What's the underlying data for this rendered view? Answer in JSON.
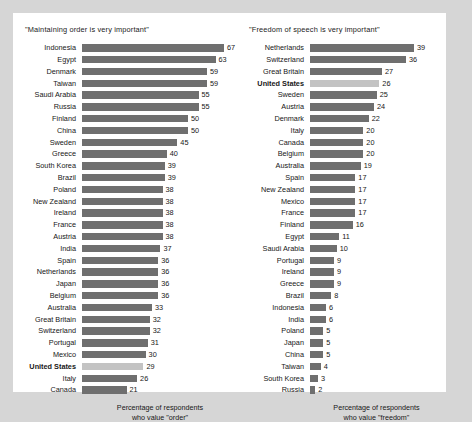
{
  "chart_data": [
    {
      "type": "bar",
      "orientation": "horizontal",
      "title": "\"Maintaining order is very important\"",
      "xlabel": "Percentage of respondents who value \"order\"",
      "ylabel": "",
      "xlim": [
        0,
        67
      ],
      "grid": false,
      "legend": "none",
      "highlight_category": "United States",
      "categories": [
        "Indonesia",
        "Egypt",
        "Denmark",
        "Taiwan",
        "Saudi Arabia",
        "Russia",
        "Finland",
        "China",
        "Sweden",
        "Greece",
        "South Korea",
        "Brazil",
        "Poland",
        "New Zealand",
        "Ireland",
        "France",
        "Austria",
        "India",
        "Spain",
        "Netherlands",
        "Japan",
        "Belgium",
        "Australia",
        "Great Britain",
        "Switzerland",
        "Portugal",
        "Mexico",
        "United States",
        "Italy",
        "Canada"
      ],
      "values": [
        67,
        63,
        59,
        59,
        55,
        55,
        50,
        50,
        45,
        40,
        39,
        39,
        38,
        38,
        38,
        38,
        38,
        37,
        36,
        36,
        36,
        36,
        33,
        32,
        32,
        31,
        30,
        29,
        26,
        21
      ]
    },
    {
      "type": "bar",
      "orientation": "horizontal",
      "title": "\"Freedom of speech is very important\"",
      "xlabel": "Percentage of respondents who value \"freedom\"",
      "ylabel": "",
      "xlim": [
        0,
        39
      ],
      "grid": false,
      "legend": "none",
      "highlight_category": "United States",
      "categories": [
        "Netherlands",
        "Switzerland",
        "Great Britain",
        "United States",
        "Sweden",
        "Austria",
        "Denmark",
        "Italy",
        "Canada",
        "Belgium",
        "Australia",
        "Spain",
        "New Zealand",
        "Mexico",
        "France",
        "Finland",
        "Egypt",
        "Saudi Arabia",
        "Portugal",
        "Ireland",
        "Greece",
        "Brazil",
        "Indonesia",
        "India",
        "Poland",
        "Japan",
        "China",
        "Taiwan",
        "South Korea",
        "Russia"
      ],
      "values": [
        39,
        36,
        27,
        26,
        25,
        24,
        22,
        20,
        20,
        20,
        19,
        17,
        17,
        17,
        17,
        16,
        11,
        10,
        9,
        9,
        9,
        8,
        6,
        6,
        5,
        5,
        5,
        4,
        3,
        2
      ]
    }
  ],
  "left_panel": {
    "title": "\"Maintaining order is very important\"",
    "caption_line1": "Percentage of respondents",
    "caption_line2": "who value \"order\""
  },
  "right_panel": {
    "title": "\"Freedom of speech is very important\"",
    "caption_line1": "Percentage of respondents",
    "caption_line2": "who value \"freedom\""
  },
  "style": {
    "bar_color": "#6f6f6f",
    "highlight_bar_color": "#c3c3c3",
    "page_background": "#d6d6d6",
    "panel_background": "#ffffff",
    "text_color": "#171717"
  }
}
